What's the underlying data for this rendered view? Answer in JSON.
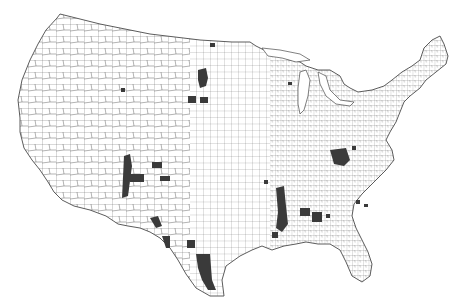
{
  "map": {
    "type": "choropleth",
    "region": "Contiguous United States",
    "unit": "county",
    "colors": {
      "background": "#ffffff",
      "county_fill": "#ffffff",
      "county_border": "#555555",
      "highlighted": "#3a3a3a"
    },
    "highlighted_regions": [
      {
        "name": "North Dakota / South Dakota cluster",
        "x": 203,
        "y": 78
      },
      {
        "name": "Northern ND county",
        "x": 212,
        "y": 46
      },
      {
        "name": "Nebraska pair",
        "x": 197,
        "y": 99
      },
      {
        "name": "Wyoming county",
        "x": 123,
        "y": 90
      },
      {
        "name": "New Mexico / Colorado vertical band",
        "x": 128,
        "y": 180
      },
      {
        "name": "New Mexico horizontal",
        "x": 140,
        "y": 178
      },
      {
        "name": "Oklahoma panhandle counties",
        "x": 158,
        "y": 166
      },
      {
        "name": "Oklahoma county",
        "x": 165,
        "y": 178
      },
      {
        "name": "West Texas border",
        "x": 156,
        "y": 222
      },
      {
        "name": "Texas Big Bend",
        "x": 165,
        "y": 243
      },
      {
        "name": "Texas Rio Grande",
        "x": 191,
        "y": 243
      },
      {
        "name": "South Texas cluster",
        "x": 205,
        "y": 268
      },
      {
        "name": "Mississippi Delta band",
        "x": 282,
        "y": 210
      },
      {
        "name": "Alabama cluster",
        "x": 305,
        "y": 213
      },
      {
        "name": "Georgia cluster",
        "x": 318,
        "y": 218
      },
      {
        "name": "Kentucky / Tennessee cluster",
        "x": 338,
        "y": 158
      },
      {
        "name": "Virginia county",
        "x": 355,
        "y": 148
      },
      {
        "name": "Southeast scattered",
        "x": 360,
        "y": 205
      },
      {
        "name": "Louisiana county",
        "x": 272,
        "y": 235
      },
      {
        "name": "Arkansas county",
        "x": 265,
        "y": 182
      },
      {
        "name": "Wisconsin county",
        "x": 291,
        "y": 84
      }
    ]
  }
}
